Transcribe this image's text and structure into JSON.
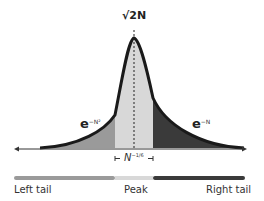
{
  "peak_label": "√2N",
  "left_decay": {
    "base": "e",
    "exp": "−N²"
  },
  "right_decay": {
    "base": "e",
    "exp": "−N"
  },
  "width_label": {
    "base": "N",
    "exp": "−1/6"
  },
  "bar": {
    "left_label": "Left tail",
    "peak_label": "Peak",
    "right_label": "Right tail",
    "colors": {
      "left": "#9a9a9a",
      "peak": "#d8d8d8",
      "right": "#3a3a3a"
    }
  }
}
